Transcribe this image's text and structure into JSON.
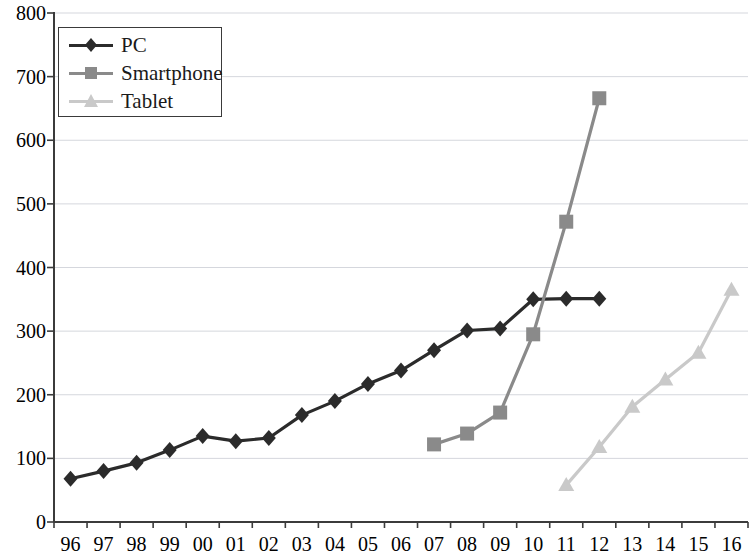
{
  "chart_data": {
    "type": "line",
    "title": "",
    "subtitle": "",
    "xlabel": "",
    "ylabel": "",
    "categories": [
      "96",
      "97",
      "98",
      "99",
      "00",
      "01",
      "02",
      "03",
      "04",
      "05",
      "06",
      "07",
      "08",
      "09",
      "10",
      "11",
      "12",
      "13",
      "14",
      "15",
      "16"
    ],
    "xtick_labels": [
      "96",
      "97",
      "98",
      "99",
      "00",
      "01",
      "02",
      "03",
      "04",
      "05",
      "06",
      "07",
      "08",
      "09",
      "10",
      "11",
      "12",
      "13",
      "14",
      "15",
      "16"
    ],
    "ytick_labels": [
      "0",
      "100",
      "200",
      "300",
      "400",
      "500",
      "600",
      "700",
      "800"
    ],
    "ytick_values": [
      0,
      100,
      200,
      300,
      400,
      500,
      600,
      700,
      800
    ],
    "ylim": [
      0,
      800
    ],
    "grid": true,
    "grid_axis": "y",
    "legend_position": "top-left",
    "series": [
      {
        "name": "PC",
        "color": "#2b2b2b",
        "marker": "diamond",
        "x": [
          "96",
          "97",
          "98",
          "99",
          "00",
          "01",
          "02",
          "03",
          "04",
          "05",
          "06",
          "07",
          "08",
          "09",
          "10",
          "11",
          "12"
        ],
        "values": [
          68,
          80,
          93,
          113,
          135,
          127,
          132,
          168,
          190,
          217,
          238,
          270,
          301,
          304,
          350,
          351,
          351
        ]
      },
      {
        "name": "Smartphone",
        "color": "#8a8a8a",
        "marker": "square",
        "x": [
          "07",
          "08",
          "09",
          "10",
          "11",
          "12"
        ],
        "values": [
          122,
          139,
          172,
          295,
          472,
          666
        ]
      },
      {
        "name": "Tablet",
        "color": "#c9c9c9",
        "marker": "triangle",
        "x": [
          "11",
          "12",
          "13",
          "14",
          "15",
          "16"
        ],
        "values": [
          58,
          118,
          181,
          224,
          266,
          365
        ]
      }
    ]
  },
  "axes": {
    "y_axis_name": "value-axis",
    "x_axis_name": "year-axis"
  }
}
